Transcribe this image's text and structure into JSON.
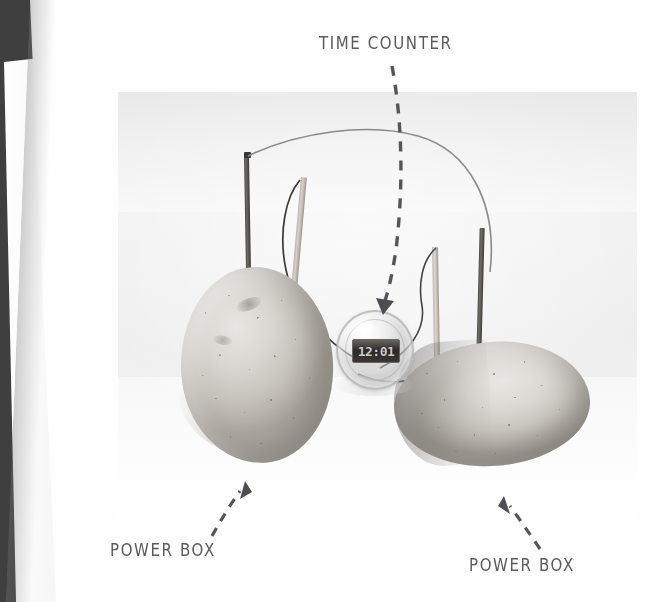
{
  "page": {
    "medium": "scanned-book-page",
    "background_color": "#fefefe",
    "gutter_color": "#3f3f3f"
  },
  "photo": {
    "subject": "potato-battery-clock-experiment",
    "background_color": "#f2f2f2",
    "objects": [
      {
        "name": "potato-left",
        "role": "power box"
      },
      {
        "name": "potato-right",
        "role": "power box"
      },
      {
        "name": "digital-clock",
        "role": "time counter"
      },
      {
        "name": "zinc-electrode-left"
      },
      {
        "name": "copper-electrode-left"
      },
      {
        "name": "zinc-electrode-right"
      },
      {
        "name": "copper-electrode-right"
      },
      {
        "name": "connecting-wire-top"
      },
      {
        "name": "connecting-wire-left"
      },
      {
        "name": "connecting-wire-right"
      }
    ]
  },
  "clock": {
    "display_value": "12:01",
    "display_color": "#cfccc6",
    "lcd_background": "#2c2a28"
  },
  "annotations": {
    "label_color": "#5b5b5f",
    "items": [
      {
        "id": "time-counter",
        "text": "TIME COUNTER",
        "arrow": "curved-dashed-down-left"
      },
      {
        "id": "power-box-left",
        "text": "POWER BOX",
        "arrow": "dashed-up-right"
      },
      {
        "id": "power-box-right",
        "text": "POWER BOX",
        "arrow": "dashed-up-left"
      }
    ]
  }
}
